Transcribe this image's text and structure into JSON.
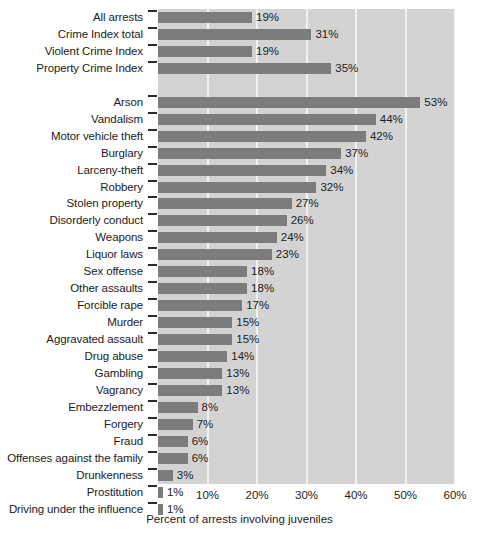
{
  "chart_data": {
    "type": "bar",
    "orientation": "horizontal",
    "title": "",
    "subtitle": "",
    "xlabel": "Percent of arrests involving juveniles",
    "ylabel": "",
    "xlim": [
      0,
      60
    ],
    "xticks": [
      10,
      20,
      30,
      40,
      50,
      60
    ],
    "xtick_labels": [
      "10%",
      "20%",
      "30%",
      "40%",
      "50%",
      "60%"
    ],
    "grid": true,
    "grid_axis": "x",
    "legend": false,
    "value_label_suffix": "%",
    "bar_color": "#7c7c7c",
    "plot_background": "#d3d3d3",
    "gridline_color": "#f2f2f2",
    "groups": [
      {
        "name": "summary",
        "categories": [
          "All arrests",
          "Crime Index total",
          "Violent Crime Index",
          "Property Crime Index"
        ],
        "values": [
          19,
          31,
          19,
          35
        ],
        "labels": [
          "19%",
          "31%",
          "19%",
          "35%"
        ]
      },
      {
        "name": "offenses",
        "categories": [
          "Arson",
          "Vandalism",
          "Motor vehicle theft",
          "Burglary",
          "Larceny-theft",
          "Robbery",
          "Stolen property",
          "Disorderly conduct",
          "Weapons",
          "Liquor laws",
          "Sex offense",
          "Other assaults",
          "Forcible rape",
          "Murder",
          "Aggravated assault",
          "Drug abuse",
          "Gambling",
          "Vagrancy",
          "Embezzlement",
          "Forgery",
          "Fraud",
          "Offenses against the family",
          "Drunkenness",
          "Prostitution",
          "Driving under the influence"
        ],
        "values": [
          53,
          44,
          42,
          37,
          34,
          32,
          27,
          26,
          24,
          23,
          18,
          18,
          17,
          15,
          15,
          14,
          13,
          13,
          8,
          7,
          6,
          6,
          3,
          1,
          1
        ],
        "labels": [
          "53%",
          "44%",
          "42%",
          "37%",
          "34%",
          "32%",
          "27%",
          "26%",
          "24%",
          "23%",
          "18%",
          "18%",
          "17%",
          "15%",
          "15%",
          "14%",
          "13%",
          "13%",
          "8%",
          "7%",
          "6%",
          "6%",
          "3%",
          "1%",
          "1%"
        ]
      }
    ],
    "categories": [
      "All arrests",
      "Crime Index total",
      "Violent Crime Index",
      "Property Crime Index",
      "Arson",
      "Vandalism",
      "Motor vehicle theft",
      "Burglary",
      "Larceny-theft",
      "Robbery",
      "Stolen property",
      "Disorderly conduct",
      "Weapons",
      "Liquor laws",
      "Sex offense",
      "Other assaults",
      "Forcible rape",
      "Murder",
      "Aggravated assault",
      "Drug abuse",
      "Gambling",
      "Vagrancy",
      "Embezzlement",
      "Forgery",
      "Fraud",
      "Offenses against the family",
      "Drunkenness",
      "Prostitution",
      "Driving under the influence"
    ],
    "values": [
      19,
      31,
      19,
      35,
      53,
      44,
      42,
      37,
      34,
      32,
      27,
      26,
      24,
      23,
      18,
      18,
      17,
      15,
      15,
      14,
      13,
      13,
      8,
      7,
      6,
      6,
      3,
      1,
      1
    ]
  }
}
